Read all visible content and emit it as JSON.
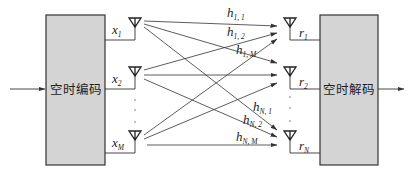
{
  "encoder": {
    "label": "空时编码"
  },
  "decoder": {
    "label": "空时解码"
  },
  "transmitters": [
    {
      "symbol": "x",
      "sub": "1"
    },
    {
      "symbol": "x",
      "sub": "2"
    },
    {
      "symbol": "x",
      "sub": "M"
    }
  ],
  "receivers": [
    {
      "symbol": "r",
      "sub": "1"
    },
    {
      "symbol": "r",
      "sub": "2"
    },
    {
      "symbol": "r",
      "sub": "N"
    }
  ],
  "channels": [
    {
      "symbol": "h",
      "sub": "1, 1"
    },
    {
      "symbol": "h",
      "sub": "1, 2"
    },
    {
      "symbol": "h",
      "sub": "1, M"
    },
    {
      "symbol": "h",
      "sub": "N, 1"
    },
    {
      "symbol": "h",
      "sub": "N, 2"
    },
    {
      "symbol": "h",
      "sub": "N, M"
    }
  ],
  "colors": {
    "box_fill": "#d4d4d4",
    "line": "#333333",
    "background": "#ffffff"
  }
}
